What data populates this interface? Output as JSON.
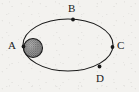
{
  "figure": {
    "type": "orbit-diagram",
    "canvas": {
      "width": 139,
      "height": 92
    },
    "background_color": "#f3f2ef",
    "stroke_color": "#1a1a1a"
  },
  "ellipse": {
    "name": "orbit-path",
    "center_x": 68,
    "center_y": 45,
    "radius_x": 45,
    "radius_y": 26,
    "stroke_width": 1.1,
    "fill": "none"
  },
  "body": {
    "name": "shaded-body",
    "center_x": 33,
    "center_y": 48,
    "radius": 9.5,
    "fill_color": "#8f8f8f",
    "outline_color": "#1a1a1a",
    "pattern": "stippled"
  },
  "points": [
    {
      "id": "A",
      "label": "A",
      "marker_x": 23.5,
      "marker_y": 46.5,
      "label_x": 8,
      "label_y": 40
    },
    {
      "id": "B",
      "label": "B",
      "marker_x": 73.0,
      "marker_y": 19.5,
      "label_x": 68,
      "label_y": 3
    },
    {
      "id": "C",
      "label": "C",
      "marker_x": 112.5,
      "marker_y": 47.0,
      "label_x": 117,
      "label_y": 40
    },
    {
      "id": "D",
      "label": "D",
      "marker_x": 99.5,
      "marker_y": 66.5,
      "label_x": 96,
      "label_y": 73
    }
  ],
  "marker": {
    "name": "point-marker",
    "radius": 1.9,
    "color": "#1a1a1a"
  }
}
